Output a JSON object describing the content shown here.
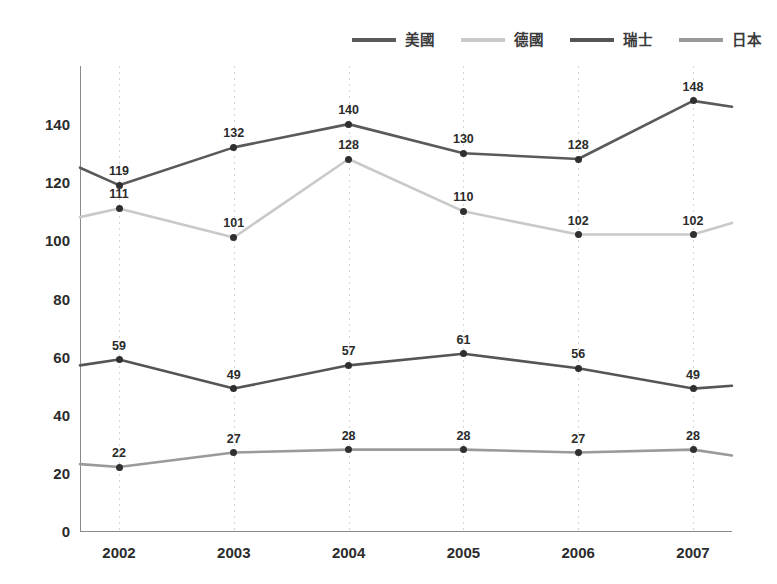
{
  "chart_data": {
    "type": "line",
    "title": "",
    "subtitle": "",
    "xlabel": "",
    "ylabel": "",
    "categories": [
      "2002",
      "2003",
      "2004",
      "2005",
      "2006",
      "2007"
    ],
    "xlim": [
      2002,
      2007
    ],
    "ylim": [
      0,
      160
    ],
    "yticks": [
      0,
      20,
      40,
      60,
      80,
      100,
      120,
      140
    ],
    "ytick_labels": [
      "0",
      "20",
      "40",
      "60",
      "80",
      "100",
      "120",
      "140"
    ],
    "grid": "vertical-dotted",
    "legend_position": "top-center",
    "data_labels": true,
    "series": [
      {
        "name": "美國",
        "color": "#5a5a5a",
        "values": [
          119,
          132,
          140,
          130,
          128,
          148
        ],
        "labels": [
          "119",
          "132",
          "140",
          "130",
          "128",
          "148"
        ],
        "lead_in_value": 125,
        "lead_out_value": 146
      },
      {
        "name": "德國",
        "color": "#c9c9c9",
        "values": [
          111,
          101,
          128,
          110,
          102,
          102
        ],
        "labels": [
          "111",
          "101",
          "128",
          "110",
          "102",
          "102"
        ],
        "lead_in_value": 108,
        "lead_out_value": 106
      },
      {
        "name": "瑞士",
        "color": "#555555",
        "values": [
          59,
          49,
          57,
          61,
          56,
          49
        ],
        "labels": [
          "59",
          "49",
          "57",
          "61",
          "56",
          "49"
        ],
        "lead_in_value": 57,
        "lead_out_value": 50
      },
      {
        "name": "日本",
        "color": "#9a9a9a",
        "values": [
          22,
          27,
          28,
          28,
          27,
          28
        ],
        "labels": [
          "22",
          "27",
          "28",
          "28",
          "27",
          "28"
        ],
        "lead_in_value": 23,
        "lead_out_value": 26
      }
    ]
  },
  "legend": {
    "items": [
      {
        "label": "美國",
        "color": "#5a5a5a"
      },
      {
        "label": "德國",
        "color": "#c9c9c9"
      },
      {
        "label": "瑞士",
        "color": "#555555"
      },
      {
        "label": "日本",
        "color": "#9a9a9a"
      }
    ]
  },
  "axes": {
    "y_labels": [
      "140",
      "120",
      "100",
      "80",
      "60",
      "40",
      "20",
      "0"
    ],
    "x_labels": [
      "2002",
      "2003",
      "2004",
      "2005",
      "2006",
      "2007"
    ]
  }
}
